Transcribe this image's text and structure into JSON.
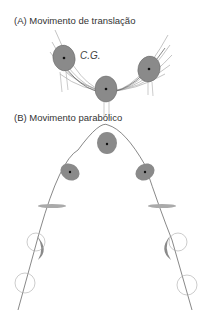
{
  "panels": {
    "a": {
      "label": "(A) Movimento de translação",
      "annotation": "C.G."
    },
    "b": {
      "label": "(B) Movimento parabólico"
    }
  },
  "colors": {
    "body_fill": "#8a8a8a",
    "line": "#555555",
    "light_line": "#aaaaaa",
    "text": "#333333"
  }
}
